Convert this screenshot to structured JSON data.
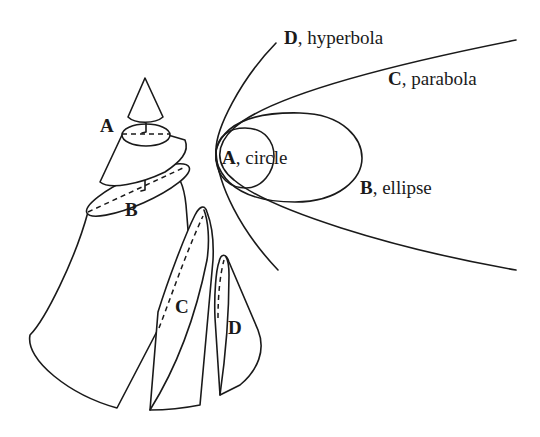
{
  "diagram": {
    "cone_labels": {
      "A": "A",
      "B": "B",
      "C": "C",
      "D": "D"
    },
    "curves": [
      {
        "letter": "A",
        "name": ", circle"
      },
      {
        "letter": "B",
        "name": ", ellipse"
      },
      {
        "letter": "C",
        "name": ", parabola"
      },
      {
        "letter": "D",
        "name": ", hyperbola"
      }
    ],
    "colors": {
      "stroke": "#1a1a1a",
      "background": "#ffffff"
    }
  }
}
